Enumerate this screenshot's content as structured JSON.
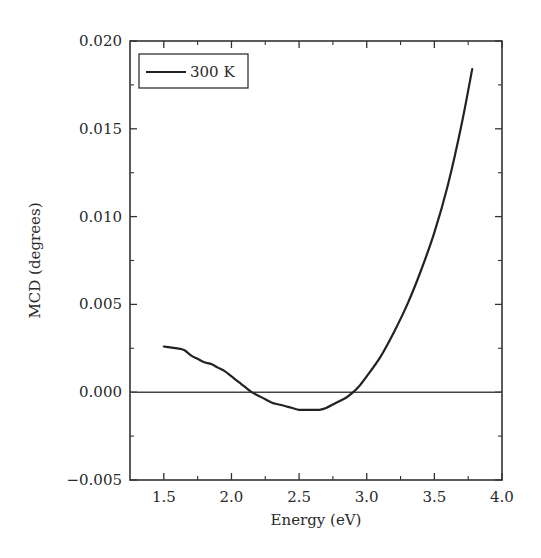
{
  "chart_data": {
    "type": "line",
    "title": "",
    "xlabel": "Energy (eV)",
    "ylabel": "MCD (degrees)",
    "xlim": [
      1.25,
      4.0
    ],
    "ylim": [
      -0.005,
      0.02
    ],
    "x_ticks": [
      1.5,
      2.0,
      2.5,
      3.0,
      3.5,
      4.0
    ],
    "x_tick_labels": [
      "1.5",
      "2.0",
      "2.5",
      "3.0",
      "3.5",
      "4.0"
    ],
    "x_minor_ticks": [
      1.75,
      2.25,
      2.75,
      3.25,
      3.75
    ],
    "y_ticks": [
      -0.005,
      0.0,
      0.005,
      0.01,
      0.015,
      0.02
    ],
    "y_tick_labels": [
      "−0.005",
      "0.000",
      "0.005",
      "0.010",
      "0.015",
      "0.020"
    ],
    "y_minor_ticks": [
      -0.0025,
      0.0025,
      0.0075,
      0.0125,
      0.0175
    ],
    "grid": false,
    "zero_line": true,
    "legend": {
      "position": "upper-left",
      "entries": [
        "300 K"
      ]
    },
    "series": [
      {
        "name": "300 K",
        "color": "#222222",
        "x": [
          1.5,
          1.6,
          1.65,
          1.7,
          1.75,
          1.8,
          1.85,
          1.9,
          1.95,
          2.0,
          2.05,
          2.1,
          2.15,
          2.2,
          2.25,
          2.3,
          2.35,
          2.4,
          2.45,
          2.5,
          2.55,
          2.6,
          2.65,
          2.7,
          2.75,
          2.8,
          2.85,
          2.9,
          2.95,
          3.0,
          3.1,
          3.2,
          3.3,
          3.4,
          3.5,
          3.6,
          3.7,
          3.78
        ],
        "y": [
          0.0026,
          0.0025,
          0.0024,
          0.0021,
          0.0019,
          0.0017,
          0.0016,
          0.0014,
          0.0012,
          0.0009,
          0.0006,
          0.0003,
          0.0,
          -0.0002,
          -0.0004,
          -0.0006,
          -0.0007,
          -0.0008,
          -0.0009,
          -0.001,
          -0.001,
          -0.001,
          -0.001,
          -0.0009,
          -0.0007,
          -0.0005,
          -0.0003,
          0.0,
          0.0004,
          0.0009,
          0.002,
          0.0034,
          0.005,
          0.0069,
          0.0091,
          0.0118,
          0.0152,
          0.0184
        ]
      }
    ]
  },
  "axes": {
    "xlabel": "Energy (eV)",
    "ylabel": "MCD (degrees)"
  },
  "legend": {
    "label": "300 K"
  }
}
